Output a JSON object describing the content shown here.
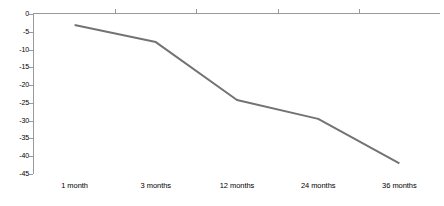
{
  "chart_data": {
    "type": "line",
    "title": "",
    "subtitle": "",
    "xlabel": "",
    "ylabel": "",
    "categories": [
      "1 month",
      "3 months",
      "12 months",
      "24 months",
      "36 months"
    ],
    "series": [
      {
        "name": "",
        "values": [
          -3.1,
          -7.9,
          -24.2,
          -29.5,
          -42.0
        ],
        "color": "#737373"
      }
    ],
    "ylim": [
      -45,
      0
    ],
    "yticks": [
      0,
      -5,
      -10,
      -15,
      -20,
      -25,
      -30,
      -35,
      -40,
      -45
    ],
    "ytick_labels": [
      "0",
      "-5",
      "-10",
      "-15",
      "-20",
      "-25",
      "-30",
      "-35",
      "-40",
      "-45"
    ],
    "grid": false,
    "legend": false,
    "legend_position": "none",
    "markers": false,
    "axis_color": "#9a9a9a",
    "text_color": "#000000",
    "background": "#ffffff"
  }
}
